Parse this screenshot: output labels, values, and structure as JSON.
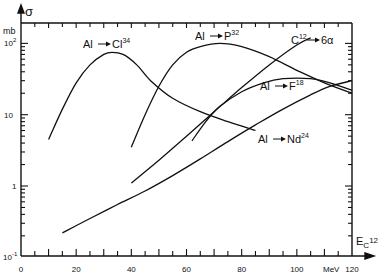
{
  "chart_data": {
    "type": "line",
    "title": "",
    "xlabel": "E_C12",
    "xunit": "MeV",
    "ylabel": "σ",
    "yunit": "mb",
    "yscale": "log",
    "xlim": [
      0,
      120
    ],
    "ylim": [
      0.1,
      150
    ],
    "x_ticks": [
      0,
      20,
      40,
      60,
      80,
      100,
      120
    ],
    "y_ticks": [
      "10^-1",
      "1",
      "10",
      "10^2"
    ],
    "grid": false,
    "series": [
      {
        "name": "Al→Cl34",
        "label": "Al",
        "label_target": "Cl",
        "label_sup": "34",
        "x": [
          10,
          15,
          20,
          25,
          30,
          33,
          37,
          42,
          47,
          55,
          65,
          75,
          85
        ],
        "y": [
          4.5,
          12,
          28,
          50,
          70,
          75,
          70,
          50,
          30,
          17,
          11,
          8,
          6
        ]
      },
      {
        "name": "Al→P32",
        "label": "Al",
        "label_target": "P",
        "label_sup": "32",
        "x": [
          40,
          45,
          50,
          55,
          60,
          65,
          72,
          80,
          90,
          100,
          110,
          120
        ],
        "y": [
          3.5,
          10,
          25,
          50,
          75,
          90,
          100,
          90,
          65,
          42,
          28,
          20
        ]
      },
      {
        "name": "C12→6α",
        "label": "C",
        "label_sup": "12",
        "label_target": "6α",
        "x": [
          40,
          50,
          60,
          70,
          80,
          90,
          100,
          105
        ],
        "y": [
          1.1,
          2.3,
          5,
          11,
          24,
          50,
          95,
          120
        ]
      },
      {
        "name": "Al→F18",
        "label": "Al",
        "label_target": "F",
        "label_sup": "18",
        "x": [
          62,
          67,
          72,
          80,
          88,
          95,
          105,
          112,
          120
        ],
        "y": [
          4.3,
          8,
          13,
          21,
          28,
          32,
          32,
          28,
          22
        ]
      },
      {
        "name": "Al→Nd24",
        "label": "Al",
        "label_target": "Nd",
        "label_sup": "24",
        "x": [
          15,
          25,
          35,
          45,
          55,
          65,
          75,
          85,
          95,
          105,
          112,
          120
        ],
        "y": [
          0.22,
          0.35,
          0.55,
          0.85,
          1.4,
          2.4,
          4.2,
          7.2,
          12,
          19,
          25,
          30
        ]
      }
    ]
  },
  "axis": {
    "y_symbol": "σ",
    "y_unit": "mb",
    "x_unit": "MeV",
    "x_symbol": "E",
    "x_sub": "C",
    "x_sup": "12",
    "x_tick_labels": [
      "0",
      "20",
      "40",
      "60",
      "80",
      "100",
      "120"
    ],
    "y_tick_labels": [
      {
        "base": "10",
        "sup": "2"
      },
      {
        "base": "10",
        "sup": ""
      },
      {
        "base": "1",
        "sup": ""
      },
      {
        "base": "10",
        "sup": "-1"
      }
    ]
  },
  "labels": {
    "cl34": {
      "from": "Al",
      "to": "Cl",
      "sup": "34"
    },
    "p32": {
      "from": "Al",
      "to": "P",
      "sup": "32"
    },
    "c12": {
      "from": "C",
      "from_sup": "12",
      "to": "6α"
    },
    "f18": {
      "from": "Al",
      "to": "F",
      "sup": "18"
    },
    "nd24": {
      "from": "Al",
      "to": "Nd",
      "sup": "24"
    }
  }
}
